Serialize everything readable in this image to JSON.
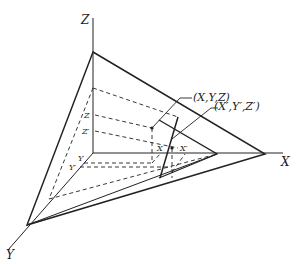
{
  "diagram": {
    "type": "3d-projection-geometry",
    "axes": {
      "x_label": "X",
      "y_label": "Y",
      "z_label": "Z"
    },
    "points": {
      "original": "(X,Y,Z)",
      "projected": "(X′,Y′,Z′)"
    },
    "tick_labels": {
      "z": "Z",
      "z_prime": "Z′",
      "y": "Y",
      "y_prime": "Y′",
      "x": "X",
      "x_prime": "X′"
    },
    "colors": {
      "line": "#222222",
      "background": "#ffffff"
    }
  }
}
